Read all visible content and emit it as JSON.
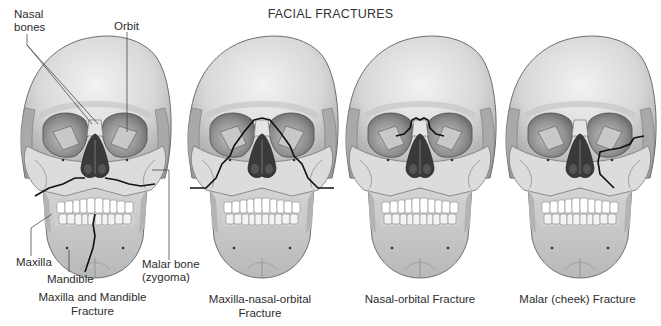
{
  "title": "FACIAL FRACTURES",
  "colors": {
    "bone": "#d6d6d6",
    "bone_light": "#ebebeb",
    "bone_shadow": "#9a9a9a",
    "cavity": "#3a3a3a",
    "fracture": "#111111",
    "teeth": "#ffffff"
  },
  "labels": {
    "nasal_bones": [
      "Nasal",
      "bones"
    ],
    "orbit": "Orbit",
    "maxilla": "Maxilla",
    "mandible": "Mandible",
    "malar_bone": [
      "Malar bone",
      "(zygoma)"
    ]
  },
  "panels": [
    {
      "id": "maxilla-mandible",
      "caption": [
        "Maxilla and Mandible",
        "Fracture"
      ]
    },
    {
      "id": "maxilla-nasal-orbital",
      "caption": [
        "Maxilla-nasal-orbital",
        "Fracture"
      ]
    },
    {
      "id": "nasal-orbital",
      "caption": [
        "Nasal-orbital Fracture"
      ]
    },
    {
      "id": "malar-cheek",
      "caption": [
        "Malar (cheek) Fracture"
      ]
    }
  ]
}
